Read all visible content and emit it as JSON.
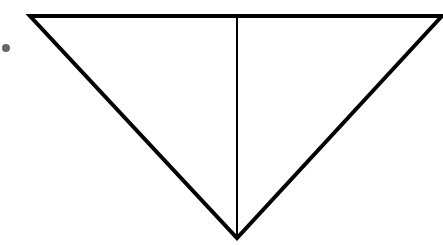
{
  "diagram": {
    "colors": {
      "stroke": "#000000",
      "dot": "#666666",
      "background": "#ffffff"
    },
    "triangle": {
      "points": [
        [
          30,
          16
        ],
        [
          442,
          16
        ],
        [
          237,
          238
        ]
      ]
    },
    "bisector": {
      "x": 237,
      "y1": 16,
      "y2": 238
    },
    "dot": {
      "cx": 6,
      "cy": 48,
      "r": 4
    }
  }
}
